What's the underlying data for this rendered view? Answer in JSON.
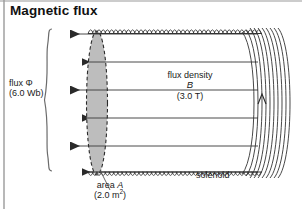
{
  "figure": {
    "title": "Magnetic flux",
    "type": "physics-diagram"
  },
  "labels": {
    "flux_name": "flux Φ",
    "flux_value": "(6.0 Wb)",
    "flux_density_name": "flux density",
    "flux_density_symbol": "B",
    "flux_density_value": "(3.0 T)",
    "area_name": "area ",
    "area_symbol": "A",
    "area_value_num": "(2.0 m",
    "area_value_sup": "2",
    "area_value_end": ")",
    "solenoid": "solenoid"
  },
  "quantities": {
    "flux_phi_Wb": 6.0,
    "flux_density_B_T": 3.0,
    "area_A_m2": 2.0
  },
  "colors": {
    "ink": "#1a1a1a",
    "line": "#3a3a3a",
    "area_fill": "#b8b8b8",
    "frame": "#9a9a9a",
    "background": "#ffffff"
  },
  "geometry": {
    "field_line_count": 6,
    "field_line_direction": "left",
    "field_line_y": [
      34,
      62,
      90,
      118,
      146,
      172
    ],
    "bracket_top_y": 30,
    "bracket_bottom_y": 172,
    "solenoid_left_x": 88,
    "solenoid_right_x": 288,
    "coil_turn_count": 42,
    "area_ellipse_cx": 97,
    "area_ellipse_rx": 10,
    "area_ellipse_ry": 72
  }
}
